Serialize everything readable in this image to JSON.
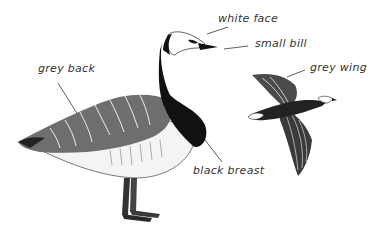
{
  "diagram": {
    "labels": [
      {
        "id": "white-face",
        "text": "white face"
      },
      {
        "id": "small-bill",
        "text": "small bill"
      },
      {
        "id": "grey-back",
        "text": "grey back"
      },
      {
        "id": "grey-wing",
        "text": "grey wing"
      },
      {
        "id": "black-breast",
        "text": "black breast"
      }
    ],
    "colors": {
      "ink": "#1a1a1a",
      "grey": "#8a8a8a",
      "white": "#ffffff",
      "label": "#333333"
    }
  }
}
